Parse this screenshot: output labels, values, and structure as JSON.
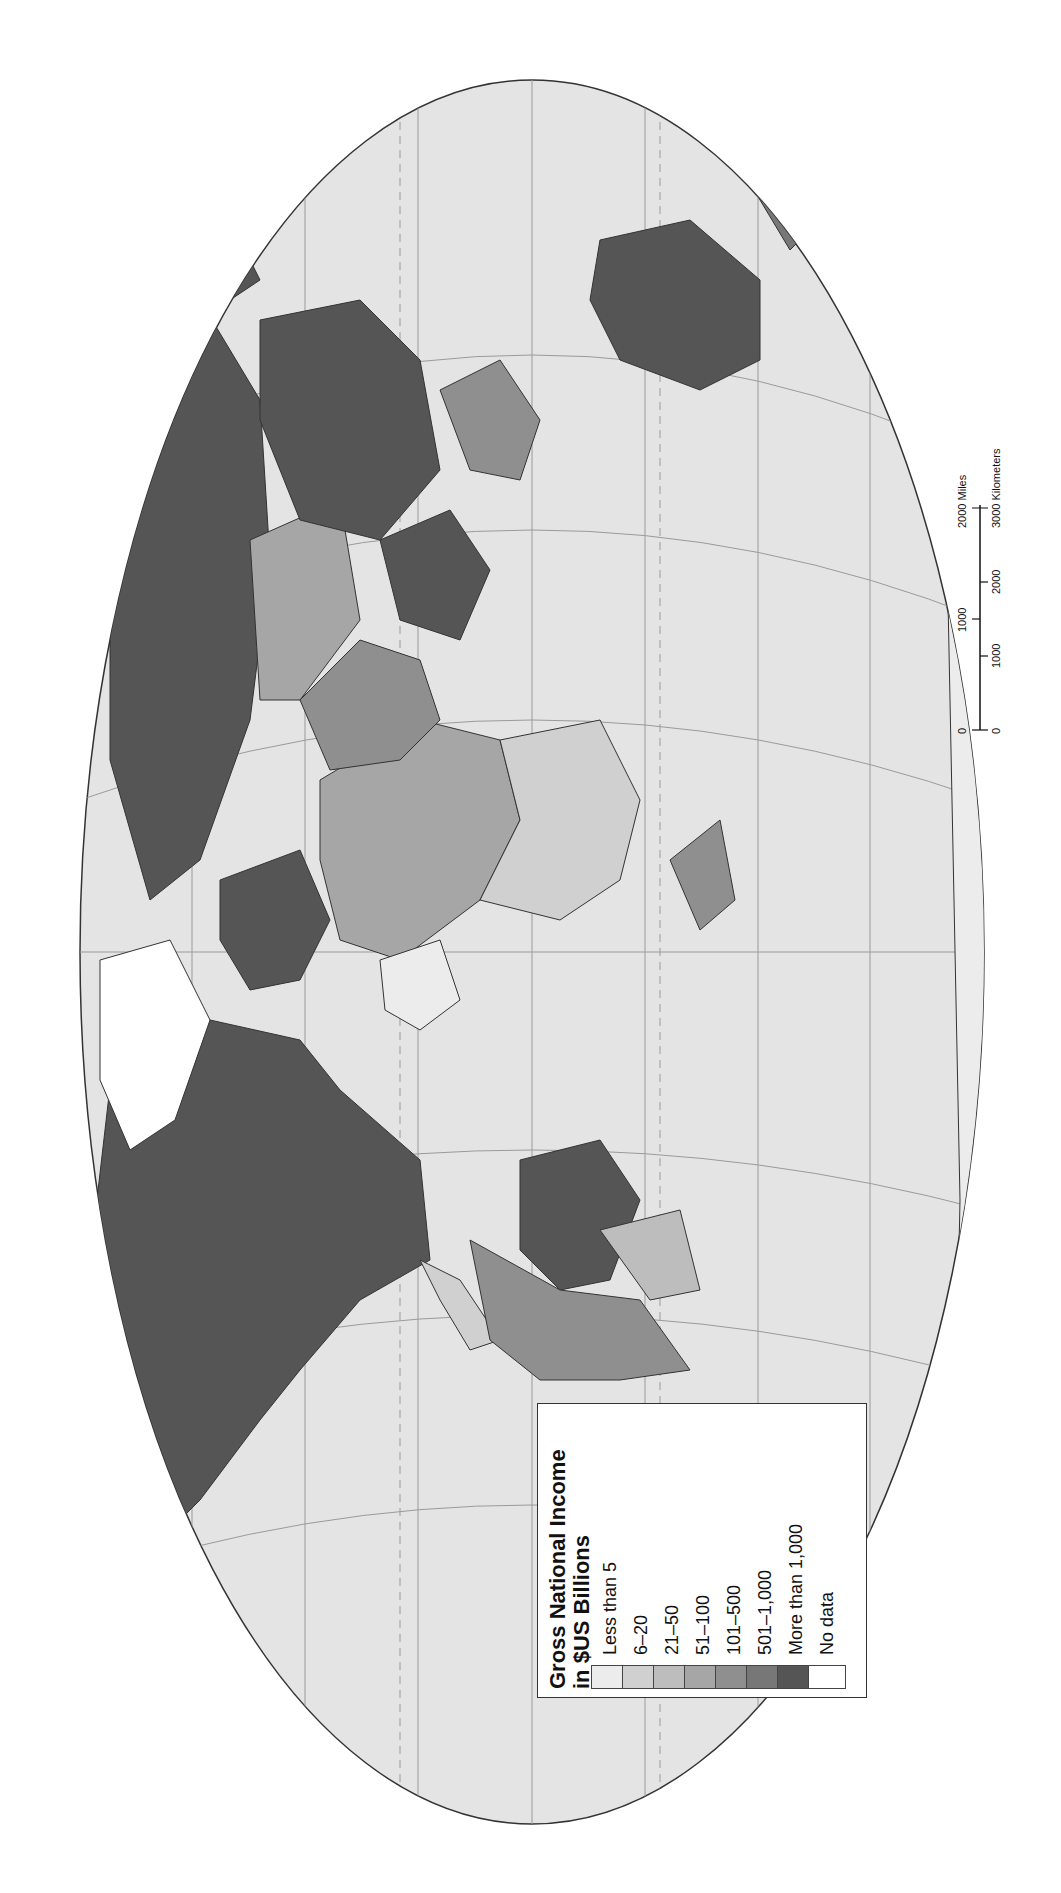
{
  "map": {
    "title": "Gross National Income in $US Billions",
    "orientation": "rotated 90 degrees clockwise",
    "colors": {
      "ocean": "#e4e4e4",
      "border": "#333333",
      "graticule": "#9a9a9a"
    }
  },
  "legend": {
    "title_line1": "Gross National Income",
    "title_line2": "in $US Billions",
    "items": [
      {
        "label": "Less than 5",
        "color": "#ececec"
      },
      {
        "label": "6–20",
        "color": "#d0d0d0"
      },
      {
        "label": "21–50",
        "color": "#bdbdbd"
      },
      {
        "label": "51–100",
        "color": "#a6a6a6"
      },
      {
        "label": "101–500",
        "color": "#8f8f8f"
      },
      {
        "label": "501–1,000",
        "color": "#777777"
      },
      {
        "label": "More than 1,000",
        "color": "#555555"
      },
      {
        "label": "No data",
        "color": "#ffffff"
      }
    ]
  },
  "scale_bar": {
    "miles_labels": [
      "0",
      "1000",
      "2000 Miles"
    ],
    "km_labels": [
      "0",
      "1000",
      "2000",
      "3000 Kilometers"
    ]
  }
}
